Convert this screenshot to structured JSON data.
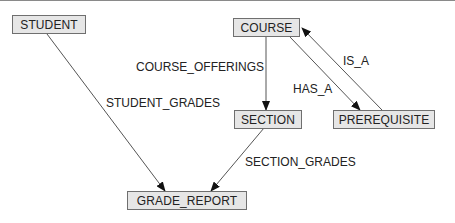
{
  "diagram": {
    "nodes": [
      {
        "id": "student",
        "label": "STUDENT"
      },
      {
        "id": "course",
        "label": "COURSE"
      },
      {
        "id": "section",
        "label": "SECTION"
      },
      {
        "id": "prerequisite",
        "label": "PREREQUISITE"
      },
      {
        "id": "grade_report",
        "label": "GRADE_REPORT"
      }
    ],
    "edges": [
      {
        "from": "student",
        "to": "grade_report",
        "label": "STUDENT_GRADES"
      },
      {
        "from": "course",
        "to": "section",
        "label": "COURSE_OFFERINGS"
      },
      {
        "from": "course",
        "to": "prerequisite",
        "label": "HAS_A"
      },
      {
        "from": "prerequisite",
        "to": "course",
        "label": "IS_A"
      },
      {
        "from": "section",
        "to": "grade_report",
        "label": "SECTION_GRADES"
      }
    ]
  }
}
